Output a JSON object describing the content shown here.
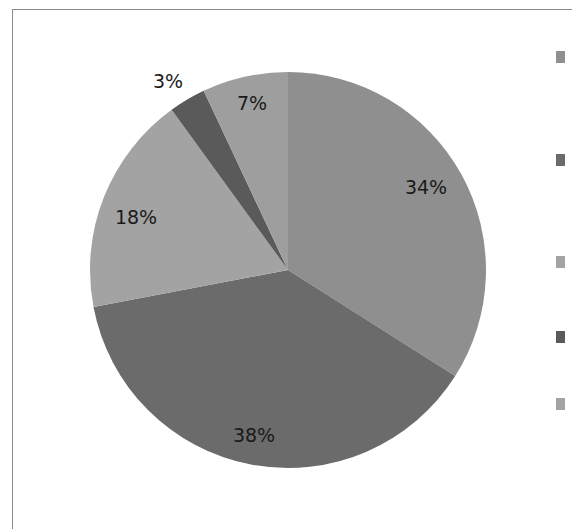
{
  "chart_data": {
    "type": "pie",
    "title": "",
    "start_angle": "top",
    "direction": "clockwise",
    "slices": [
      {
        "label": "",
        "value": 34,
        "display": "34%",
        "color": "#8f8f8f"
      },
      {
        "label": "",
        "value": 38,
        "display": "38%",
        "color": "#6b6b6b"
      },
      {
        "label": "",
        "value": 18,
        "display": "18%",
        "color": "#a3a3a3"
      },
      {
        "label": "",
        "value": 3,
        "display": "3%",
        "color": "#5a5a5a"
      },
      {
        "label": "",
        "value": 7,
        "display": "7%",
        "color": "#9e9e9e"
      }
    ],
    "legend": {
      "placement": "right",
      "entries": [
        {
          "label": "",
          "color": "#8f8f8f"
        },
        {
          "label": "",
          "color": "#6b6b6b"
        },
        {
          "label": "",
          "color": "#a3a3a3"
        },
        {
          "label": "",
          "color": "#5a5a5a"
        },
        {
          "label": "",
          "color": "#a3a3a3"
        }
      ]
    }
  }
}
